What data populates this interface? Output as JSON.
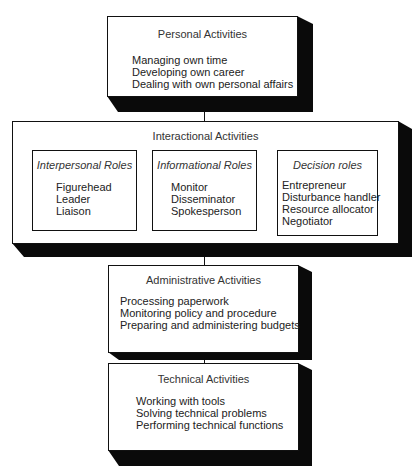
{
  "diagram": {
    "personal": {
      "title": "Personal Activities",
      "items": [
        "Managing own time",
        "Developing own career",
        "Dealing with own personal affairs"
      ]
    },
    "interactional": {
      "title": "Interactional Activities",
      "roles": [
        {
          "title": "Interpersonal Roles",
          "items": [
            "Figurehead",
            "Leader",
            "Liaison"
          ]
        },
        {
          "title": "Informational Roles",
          "items": [
            "Monitor",
            "Disseminator",
            "Spokesperson"
          ]
        },
        {
          "title": "Decision roles",
          "items": [
            "Entrepreneur",
            "Disturbance handler",
            "Resource allocator",
            "Negotiator"
          ]
        }
      ]
    },
    "administrative": {
      "title": "Administrative Activities",
      "items": [
        "Processing paperwork",
        "Monitoring policy and procedure",
        "Preparing and administering budgets"
      ]
    },
    "technical": {
      "title": "Technical Activities",
      "items": [
        "Working with tools",
        "Solving technical problems",
        "Performing technical functions"
      ]
    }
  }
}
